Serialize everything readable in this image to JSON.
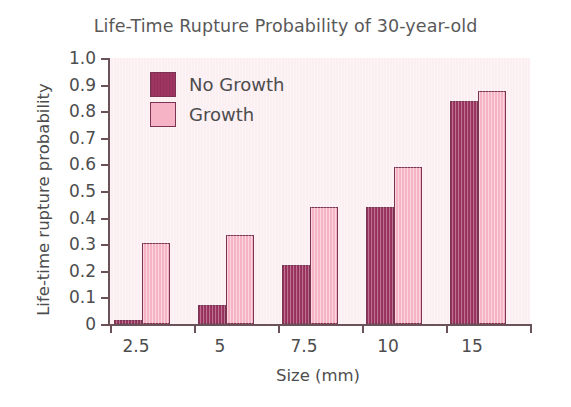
{
  "chart_data": {
    "type": "bar",
    "title": "Life-Time Rupture Probability of 30-year-old",
    "xlabel": "Size (mm)",
    "ylabel": "Life-time rupture probability",
    "categories": [
      "2.5",
      "5",
      "7.5",
      "10",
      "15"
    ],
    "series": [
      {
        "name": "No Growth",
        "color": "#9f3562",
        "values": [
          0.015,
          0.07,
          0.22,
          0.44,
          0.84
        ]
      },
      {
        "name": "Growth",
        "color": "#f6b3c6",
        "values": [
          0.305,
          0.335,
          0.44,
          0.59,
          0.875
        ]
      }
    ],
    "ylim": [
      0,
      1.0
    ],
    "y_ticks": [
      "0",
      "0.1",
      "0.2",
      "0.3",
      "0.4",
      "0.5",
      "0.6",
      "0.7",
      "0.8",
      "0.9",
      "1.0"
    ],
    "y_tick_values": [
      0,
      0.1,
      0.2,
      0.3,
      0.4,
      0.5,
      0.6,
      0.7,
      0.8,
      0.9,
      1.0
    ],
    "grid": false,
    "legend_position": "top-left",
    "plot_background": "#fbeff2",
    "figure_background": "#ffffff",
    "axis_color": "#6b5158"
  },
  "legend": {
    "items": [
      {
        "label": "No Growth",
        "swatch": "no-growth"
      },
      {
        "label": "Growth",
        "swatch": "growth"
      }
    ]
  }
}
